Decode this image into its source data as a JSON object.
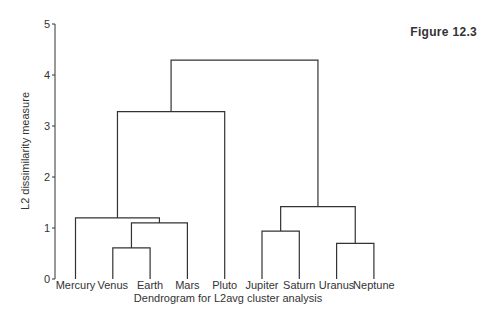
{
  "figure_label": "Figure 12.3",
  "chart_data": {
    "type": "dendrogram",
    "title": "",
    "xlabel": "Dendrogram for L2avg cluster analysis",
    "ylabel": "L2 dissimilarity measure",
    "ylim": [
      0,
      5
    ],
    "yticks": [
      0,
      1,
      2,
      3,
      4,
      5
    ],
    "grid": false,
    "leaves": [
      "Mercury",
      "Venus",
      "Earth",
      "Mars",
      "Pluto",
      "Jupiter",
      "Saturn",
      "Uranus",
      "Neptune"
    ],
    "merges": [
      {
        "id": "VE",
        "children": [
          "Venus",
          "Earth"
        ],
        "height": 0.61
      },
      {
        "id": "VEM",
        "children": [
          "VE",
          "Mars"
        ],
        "height": 1.1
      },
      {
        "id": "MVEM",
        "children": [
          "Mercury",
          "VEM"
        ],
        "height": 1.2
      },
      {
        "id": "INNER",
        "children": [
          "MVEM",
          "Pluto"
        ],
        "height": 3.28
      },
      {
        "id": "JS",
        "children": [
          "Jupiter",
          "Saturn"
        ],
        "height": 0.94
      },
      {
        "id": "UN",
        "children": [
          "Uranus",
          "Neptune"
        ],
        "height": 0.7
      },
      {
        "id": "OUTER",
        "children": [
          "JS",
          "UN"
        ],
        "height": 1.42
      },
      {
        "id": "ROOT",
        "children": [
          "INNER",
          "OUTER"
        ],
        "height": 4.29
      }
    ]
  },
  "colors": {
    "line": "#333333",
    "text": "#333333",
    "background": "#ffffff"
  }
}
